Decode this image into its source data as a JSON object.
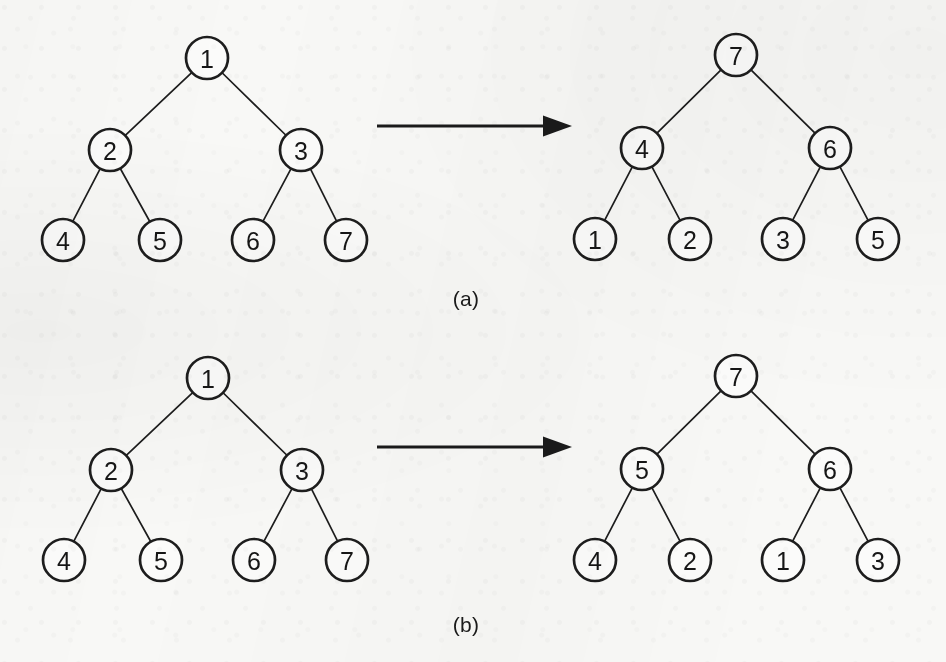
{
  "figure": {
    "background_color": "#f8f8f6",
    "ink_color": "#1a1a1a",
    "panels": [
      {
        "id": "a",
        "caption": "(a)",
        "caption_x": 466,
        "caption_y": 299,
        "arrow": {
          "x1": 377,
          "y1": 126,
          "x2": 572,
          "y2": 126
        },
        "trees": [
          {
            "role": "before",
            "nodes": [
              {
                "label": "1",
                "x": 207,
                "y": 58,
                "level": 0
              },
              {
                "label": "2",
                "x": 110,
                "y": 150,
                "level": 1
              },
              {
                "label": "3",
                "x": 301,
                "y": 150,
                "level": 1
              },
              {
                "label": "4",
                "x": 63,
                "y": 240,
                "level": 2
              },
              {
                "label": "5",
                "x": 160,
                "y": 240,
                "level": 2
              },
              {
                "label": "6",
                "x": 253,
                "y": 240,
                "level": 2
              },
              {
                "label": "7",
                "x": 346,
                "y": 240,
                "level": 2
              }
            ],
            "edges": [
              [
                0,
                1
              ],
              [
                0,
                2
              ],
              [
                1,
                3
              ],
              [
                1,
                4
              ],
              [
                2,
                5
              ],
              [
                2,
                6
              ]
            ]
          },
          {
            "role": "after",
            "nodes": [
              {
                "label": "7",
                "x": 736,
                "y": 55,
                "level": 0
              },
              {
                "label": "4",
                "x": 642,
                "y": 148,
                "level": 1
              },
              {
                "label": "6",
                "x": 830,
                "y": 148,
                "level": 1
              },
              {
                "label": "1",
                "x": 595,
                "y": 239,
                "level": 2
              },
              {
                "label": "2",
                "x": 690,
                "y": 239,
                "level": 2
              },
              {
                "label": "3",
                "x": 783,
                "y": 239,
                "level": 2
              },
              {
                "label": "5",
                "x": 878,
                "y": 239,
                "level": 2
              }
            ],
            "edges": [
              [
                0,
                1
              ],
              [
                0,
                2
              ],
              [
                1,
                3
              ],
              [
                1,
                4
              ],
              [
                2,
                5
              ],
              [
                2,
                6
              ]
            ]
          }
        ]
      },
      {
        "id": "b",
        "caption": "(b)",
        "caption_x": 466,
        "caption_y": 625,
        "arrow": {
          "x1": 377,
          "y1": 447,
          "x2": 572,
          "y2": 447
        },
        "trees": [
          {
            "role": "before",
            "nodes": [
              {
                "label": "1",
                "x": 208,
                "y": 378,
                "level": 0
              },
              {
                "label": "2",
                "x": 111,
                "y": 470,
                "level": 1
              },
              {
                "label": "3",
                "x": 302,
                "y": 470,
                "level": 1
              },
              {
                "label": "4",
                "x": 64,
                "y": 560,
                "level": 2
              },
              {
                "label": "5",
                "x": 161,
                "y": 560,
                "level": 2
              },
              {
                "label": "6",
                "x": 254,
                "y": 560,
                "level": 2
              },
              {
                "label": "7",
                "x": 347,
                "y": 560,
                "level": 2
              }
            ],
            "edges": [
              [
                0,
                1
              ],
              [
                0,
                2
              ],
              [
                1,
                3
              ],
              [
                1,
                4
              ],
              [
                2,
                5
              ],
              [
                2,
                6
              ]
            ]
          },
          {
            "role": "after",
            "nodes": [
              {
                "label": "7",
                "x": 736,
                "y": 376,
                "level": 0
              },
              {
                "label": "5",
                "x": 642,
                "y": 469,
                "level": 1
              },
              {
                "label": "6",
                "x": 830,
                "y": 469,
                "level": 1
              },
              {
                "label": "4",
                "x": 595,
                "y": 560,
                "level": 2
              },
              {
                "label": "2",
                "x": 690,
                "y": 560,
                "level": 2
              },
              {
                "label": "1",
                "x": 783,
                "y": 560,
                "level": 2
              },
              {
                "label": "3",
                "x": 878,
                "y": 560,
                "level": 2
              }
            ],
            "edges": [
              [
                0,
                1
              ],
              [
                0,
                2
              ],
              [
                1,
                3
              ],
              [
                1,
                4
              ],
              [
                2,
                5
              ],
              [
                2,
                6
              ]
            ]
          }
        ]
      }
    ],
    "node_radius": 21,
    "bleed_through_lines": [
      {
        "text": "distributed the elements of the set over",
        "x": 68,
        "y": 398,
        "size": 15
      },
      {
        "text": "processors in the system",
        "x": 470,
        "y": 398,
        "size": 15
      },
      {
        "text": "a balanced binary tree structure and each",
        "x": 52,
        "y": 424,
        "size": 15
      },
      {
        "text": "of the nodes",
        "x": 612,
        "y": 424,
        "size": 15
      },
      {
        "text": "When a set is stored in this manner it is",
        "x": 46,
        "y": 480,
        "size": 15
      },
      {
        "text": "possible to search",
        "x": 620,
        "y": 480,
        "size": 15
      },
      {
        "text": "the tree in parallel and the time required",
        "x": 44,
        "y": 508,
        "size": 15
      },
      {
        "text": "to locate an element",
        "x": 616,
        "y": 508,
        "size": 15
      },
      {
        "text": "depends on the depth of the tree and the",
        "x": 46,
        "y": 534,
        "size": 15
      },
      {
        "text": "number of levels",
        "x": 624,
        "y": 534,
        "size": 15
      },
      {
        "text": "that can be searched concurrently by the",
        "x": 44,
        "y": 560,
        "size": 15
      },
      {
        "text": "available processors",
        "x": 620,
        "y": 560,
        "size": 15
      },
      {
        "text": "in the network of the parallel machine",
        "x": 48,
        "y": 586,
        "size": 15
      },
      {
        "text": "configuration",
        "x": 626,
        "y": 586,
        "size": 15
      },
      {
        "text": "of the tree nodes",
        "x": 660,
        "y": 32,
        "size": 14
      },
      {
        "text": "the set elements",
        "x": 120,
        "y": 312,
        "size": 14
      },
      {
        "text": "search",
        "x": 330,
        "y": 338,
        "size": 14
      }
    ]
  }
}
